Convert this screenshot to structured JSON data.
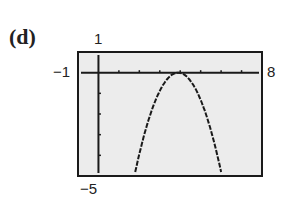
{
  "part_label": "(d)",
  "window": {
    "xmin_label": "−1",
    "xmax_label": "8",
    "ymax_label": "1",
    "ymin_label": "−5"
  },
  "colors": {
    "screen_bg": "#ececec",
    "ink": "#1a1a1a"
  },
  "chart_data": {
    "type": "line",
    "title": "(d)",
    "xlabel": "",
    "ylabel": "",
    "xlim": [
      -1,
      8
    ],
    "ylim": [
      -5,
      1
    ],
    "grid": false,
    "x_ticks": [
      1,
      2,
      3,
      4,
      5,
      6,
      7
    ],
    "y_ticks": [
      -1,
      -2,
      -3,
      -4
    ],
    "series": [
      {
        "name": "parabola",
        "x": [
          1.8,
          2.2,
          2.6,
          3.0,
          3.4,
          3.9,
          4.4,
          4.8,
          5.2,
          5.6,
          6.0
        ],
        "y": [
          -4.8,
          -3.0,
          -1.8,
          -0.8,
          -0.3,
          0.0,
          -0.3,
          -0.8,
          -1.8,
          -3.0,
          -4.8
        ]
      }
    ]
  }
}
